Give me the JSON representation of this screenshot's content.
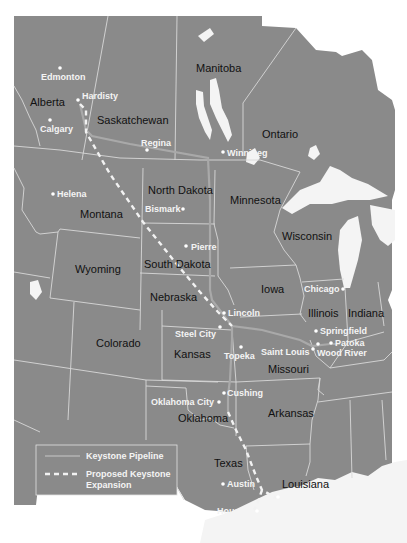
{
  "map": {
    "colors": {
      "land": "#8a8a8a",
      "border": "#d8d8d8",
      "water": "#f4f4f4",
      "existing_pipeline": "#a9a9a9",
      "proposed_pipeline": "#f2f2f2",
      "region_label": "#111111",
      "city_label": "#f4f4f4"
    },
    "regions": [
      {
        "id": "alberta",
        "label": "Alberta"
      },
      {
        "id": "saskatchewan",
        "label": "Saskatchewan"
      },
      {
        "id": "manitoba",
        "label": "Manitoba"
      },
      {
        "id": "ontario",
        "label": "Ontario"
      },
      {
        "id": "montana",
        "label": "Montana"
      },
      {
        "id": "north-dakota",
        "label": "North Dakota"
      },
      {
        "id": "minnesota",
        "label": "Minnesota"
      },
      {
        "id": "wisconsin",
        "label": "Wisconsin"
      },
      {
        "id": "wyoming",
        "label": "Wyoming"
      },
      {
        "id": "south-dakota",
        "label": "South Dakota"
      },
      {
        "id": "nebraska",
        "label": "Nebraska"
      },
      {
        "id": "iowa",
        "label": "Iowa"
      },
      {
        "id": "illinois",
        "label": "Illinois"
      },
      {
        "id": "indiana",
        "label": "Indiana"
      },
      {
        "id": "colorado",
        "label": "Colorado"
      },
      {
        "id": "kansas",
        "label": "Kansas"
      },
      {
        "id": "missouri",
        "label": "Missouri"
      },
      {
        "id": "oklahoma",
        "label": "Oklahoma"
      },
      {
        "id": "arkansas",
        "label": "Arkansas"
      },
      {
        "id": "texas",
        "label": "Texas"
      },
      {
        "id": "louisiana",
        "label": "Louisiana"
      }
    ],
    "cities": [
      {
        "id": "edmonton",
        "label": "Edmonton"
      },
      {
        "id": "hardisty",
        "label": "Hardisty"
      },
      {
        "id": "calgary",
        "label": "Calgary"
      },
      {
        "id": "regina",
        "label": "Regina"
      },
      {
        "id": "winnipeg",
        "label": "Winnipeg"
      },
      {
        "id": "helena",
        "label": "Helena"
      },
      {
        "id": "bismark",
        "label": "Bismark"
      },
      {
        "id": "pierre",
        "label": "Pierre"
      },
      {
        "id": "chicago",
        "label": "Chicago"
      },
      {
        "id": "lincoln",
        "label": "Lincoln"
      },
      {
        "id": "springfield",
        "label": "Springfield"
      },
      {
        "id": "steel-city",
        "label": "Steel City"
      },
      {
        "id": "patoka",
        "label": "Patoka"
      },
      {
        "id": "saint-louis",
        "label": "Saint Louis"
      },
      {
        "id": "wood-river",
        "label": "Wood River"
      },
      {
        "id": "topeka",
        "label": "Topeka"
      },
      {
        "id": "cushing",
        "label": "Cushing"
      },
      {
        "id": "oklahoma-city",
        "label": "Oklahoma City"
      },
      {
        "id": "austin",
        "label": "Austin"
      },
      {
        "id": "port-arthur",
        "label": "Port Arthur"
      },
      {
        "id": "houston",
        "label": "Houston"
      }
    ],
    "legend": {
      "existing_label": "Keystone Pipeline",
      "proposed_label_line1": "Proposed Keystone",
      "proposed_label_line2": "Expansion"
    }
  }
}
